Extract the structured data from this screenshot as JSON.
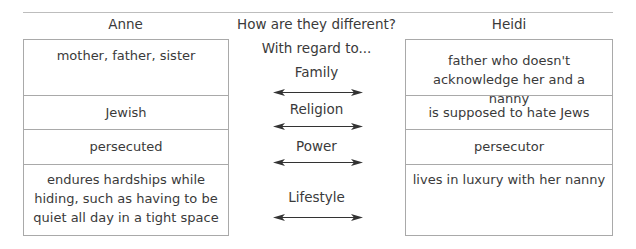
{
  "headers": {
    "left": "Anne",
    "middle": "How are they different?",
    "right": "Heidi"
  },
  "middle_intro": "With regard to...",
  "rows": [
    {
      "category": "Family",
      "anne": "mother, father, sister",
      "heidi": "father who doesn't acknowledge her and a nanny"
    },
    {
      "category": "Religion",
      "anne": "Jewish",
      "heidi": "is supposed to hate Jews"
    },
    {
      "category": "Power",
      "anne": "persecuted",
      "heidi": "persecutor"
    },
    {
      "category": "Lifestyle",
      "anne": "endures hardships while hiding, such as having to be quiet all day in a tight space",
      "heidi": "lives in luxury with her nanny"
    }
  ],
  "icons": {
    "arrow": "double-headed-arrow-icon"
  },
  "colors": {
    "border": "#a9a9a9",
    "text": "#3a3a3a"
  }
}
